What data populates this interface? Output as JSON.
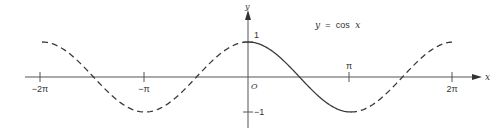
{
  "chart_data": {
    "type": "line",
    "title": "y = cos x",
    "title_parts": {
      "lhs": "y",
      "eq": "=",
      "fn": "cos",
      "arg": "x"
    },
    "xlabel": "x",
    "ylabel": "y",
    "origin_label": "O",
    "xlim": [
      -6.7,
      6.7
    ],
    "ylim": [
      -1.3,
      1.5
    ],
    "x_ticks": [
      {
        "value": -6.2832,
        "label": "−2π"
      },
      {
        "value": -3.1416,
        "label": "−π"
      },
      {
        "value": 3.1416,
        "label": "π"
      },
      {
        "value": 6.2832,
        "label": "2π"
      }
    ],
    "y_ticks": [
      {
        "value": 1,
        "label": "1"
      },
      {
        "value": -1,
        "label": "−1"
      }
    ],
    "grid": false,
    "legend": null,
    "series": [
      {
        "name": "cos x (dashed, x in [-2π, 0])",
        "style": "dashed",
        "x_range": [
          -6.2832,
          0
        ],
        "x": [
          -6.2832,
          -4.7124,
          -3.1416,
          -1.5708,
          0
        ],
        "values": [
          1,
          0,
          -1,
          0,
          1
        ]
      },
      {
        "name": "cos x (solid, x in [0, π])",
        "style": "solid",
        "x_range": [
          0,
          3.1416
        ],
        "x": [
          0,
          1.5708,
          3.1416
        ],
        "values": [
          1,
          0,
          -1
        ]
      },
      {
        "name": "cos x (dashed, x in [π, 2π])",
        "style": "dashed",
        "x_range": [
          3.1416,
          6.2832
        ],
        "x": [
          3.1416,
          4.7124,
          6.2832
        ],
        "values": [
          -1,
          0,
          1
        ]
      }
    ],
    "colors": {
      "curve": "#3a3a3a",
      "axis": "#555555",
      "text": "#333333"
    }
  }
}
